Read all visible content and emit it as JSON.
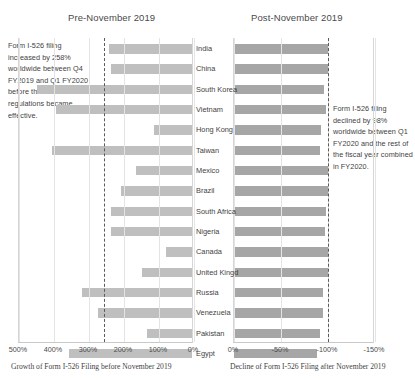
{
  "panels": {
    "left": {
      "title": "Pre-November 2019",
      "axis_caption": "Growth of Form I-526 Filing before November 2019"
    },
    "right": {
      "title": "Post-November 2019",
      "axis_caption": "Decline of Form I-526 Filing after November 2019"
    }
  },
  "annotations": {
    "left": "Form I-526 filing increased by 258% worldwide between Q4 FY2019 and Q1 FY2020 before the new EB-5 regulations became effective.",
    "right": "Form I-526 filing declined by 98% worldwide between Q1 FY2020 and the rest of the fiscal year combined in FY2020."
  },
  "colors": {
    "bar_left": "#bfbfbf",
    "bar_right": "#a6a6a6",
    "reference_line": "#5a5a5a",
    "gridline": "#e4e4e4"
  },
  "chart_data": [
    {
      "type": "bar",
      "orientation": "horizontal",
      "title": "Pre-November 2019",
      "xlabel": "Growth of Form I-526 Filing before November 2019",
      "ylabel": "",
      "xlim": [
        500,
        0
      ],
      "xticks": [
        "500%",
        "400%",
        "300%",
        "200%",
        "100%",
        "0%"
      ],
      "xtick_values": [
        500,
        400,
        300,
        200,
        100,
        0
      ],
      "reference_line": 258,
      "grid": true,
      "legend": "none",
      "categories": [
        "India",
        "China",
        "South Korea",
        "Vietnam",
        "Hong Kong",
        "Taiwan",
        "Mexico",
        "Brazil",
        "South Africa",
        "Nigeria",
        "Canada",
        "United Kingd",
        "Russia",
        "Venezuela",
        "Pakistan",
        "Egypt"
      ],
      "values": [
        263,
        268,
        57,
        112,
        390,
        100,
        340,
        298,
        268,
        268,
        425,
        357,
        186,
        231,
        371,
        148
      ]
    },
    {
      "type": "bar",
      "orientation": "horizontal",
      "title": "Post-November 2019",
      "xlabel": "Decline of Form I-526 Filing after November 2019",
      "ylabel": "",
      "xlim": [
        0,
        -150
      ],
      "xticks": [
        "0%",
        "-50%",
        "-100%",
        "-150%"
      ],
      "xtick_values": [
        0,
        -50,
        -100,
        -150
      ],
      "reference_line": -100,
      "grid": true,
      "legend": "none",
      "categories": [
        "India",
        "China",
        "South Korea",
        "Vietnam",
        "Hong Kong",
        "Taiwan",
        "Mexico",
        "Brazil",
        "South Africa",
        "Nigeria",
        "Canada",
        "United Kingd",
        "Russia",
        "Venezuela",
        "Pakistan",
        "Egypt"
      ],
      "values": [
        -100,
        -100,
        -96,
        -98,
        -93,
        -92,
        -100,
        -100,
        -98,
        -97,
        -100,
        -100,
        -95,
        -95,
        -92,
        -88
      ]
    }
  ]
}
